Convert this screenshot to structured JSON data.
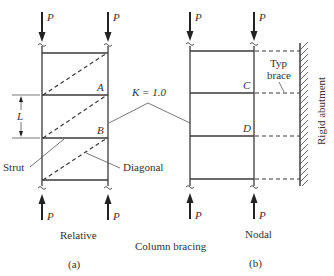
{
  "figure": {
    "caption": "Column bracing",
    "load_label": "P",
    "effective_length_factor": "K = 1.0",
    "panel_a": {
      "sublabel": "(a)",
      "type_label": "Relative",
      "node_labels": [
        "A",
        "B"
      ],
      "length_label": "L",
      "callouts": {
        "strut": "Strut",
        "diagonal": "Diagonal"
      }
    },
    "panel_b": {
      "sublabel": "(b)",
      "type_label": "Nodal",
      "node_labels": [
        "C",
        "D"
      ],
      "callouts": {
        "brace": [
          "Typ",
          "brace"
        ],
        "abutment": "Rigid abutment"
      }
    }
  },
  "colors": {
    "line": "#3a3a3a",
    "text": "#333333",
    "background": "#ffffff"
  }
}
